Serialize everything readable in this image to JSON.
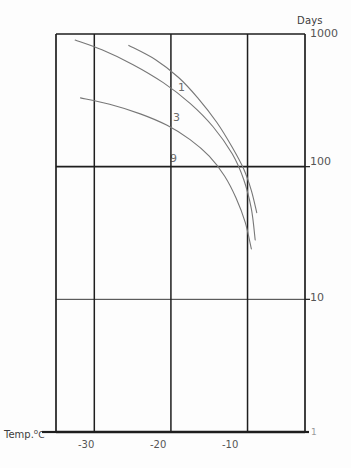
{
  "chart_data": {
    "type": "line",
    "title": "",
    "subtitle": "",
    "xlabel": "Temp. °C",
    "ylabel": "Days",
    "yscale": "log",
    "xscale": "linear",
    "xlim": [
      -35,
      -2.5
    ],
    "ylim": [
      1,
      1000
    ],
    "grid": true,
    "legend_position": "inline-curve-labels",
    "x_ticks": [
      "-30",
      "-20",
      "-10"
    ],
    "x_tick_values": [
      -30,
      -20,
      -10
    ],
    "y_ticks": [
      "1000",
      "100",
      "10",
      "1"
    ],
    "y_tick_values": [
      1000,
      100,
      10,
      1
    ],
    "annotations": [
      {
        "text": "1",
        "x": -14.0,
        "y": 430
      },
      {
        "text": "3",
        "x": -14.6,
        "y": 250
      },
      {
        "text": "9",
        "x": -14.8,
        "y": 108
      }
    ],
    "series": [
      {
        "name": "1",
        "label": "1",
        "points": [
          {
            "x": -25.5,
            "y": 820
          },
          {
            "x": -22.0,
            "y": 640
          },
          {
            "x": -19.0,
            "y": 470
          },
          {
            "x": -16.5,
            "y": 330
          },
          {
            "x": -14.0,
            "y": 215
          },
          {
            "x": -12.0,
            "y": 140
          },
          {
            "x": -10.5,
            "y": 96
          },
          {
            "x": -9.5,
            "y": 66
          },
          {
            "x": -8.8,
            "y": 45
          }
        ]
      },
      {
        "name": "3",
        "label": "3",
        "points": [
          {
            "x": -32.5,
            "y": 900
          },
          {
            "x": -29.0,
            "y": 760
          },
          {
            "x": -25.0,
            "y": 590
          },
          {
            "x": -21.0,
            "y": 430
          },
          {
            "x": -17.5,
            "y": 300
          },
          {
            "x": -14.5,
            "y": 200
          },
          {
            "x": -12.0,
            "y": 125
          },
          {
            "x": -10.5,
            "y": 80
          },
          {
            "x": -9.5,
            "y": 48
          },
          {
            "x": -9.0,
            "y": 28
          }
        ]
      },
      {
        "name": "9",
        "label": "9",
        "points": [
          {
            "x": -31.8,
            "y": 330
          },
          {
            "x": -28.0,
            "y": 295
          },
          {
            "x": -24.0,
            "y": 250
          },
          {
            "x": -20.5,
            "y": 205
          },
          {
            "x": -17.5,
            "y": 160
          },
          {
            "x": -15.0,
            "y": 120
          },
          {
            "x": -13.0,
            "y": 85
          },
          {
            "x": -11.5,
            "y": 58
          },
          {
            "x": -10.3,
            "y": 38
          },
          {
            "x": -9.5,
            "y": 24
          }
        ]
      }
    ]
  },
  "axes": {
    "y_axis_title": "Days",
    "x_axis_title_prefix": "Temp.",
    "x_axis_title_degree": "o",
    "x_axis_title_unit": "C",
    "y_tick_1000": "1000",
    "y_tick_100": "100",
    "y_tick_10": "10",
    "y_tick_1": "1",
    "x_tick_m30": "-30",
    "x_tick_m20": "-20",
    "x_tick_m10": "-10"
  },
  "curve_labels": {
    "one": "1",
    "three": "3",
    "nine": "9"
  },
  "colors": {
    "background": "#fdfdfd",
    "frame": "#1e1e1e",
    "gridline": "#3a3a3a",
    "curve": "#777777",
    "text": "#4a4a4a"
  }
}
